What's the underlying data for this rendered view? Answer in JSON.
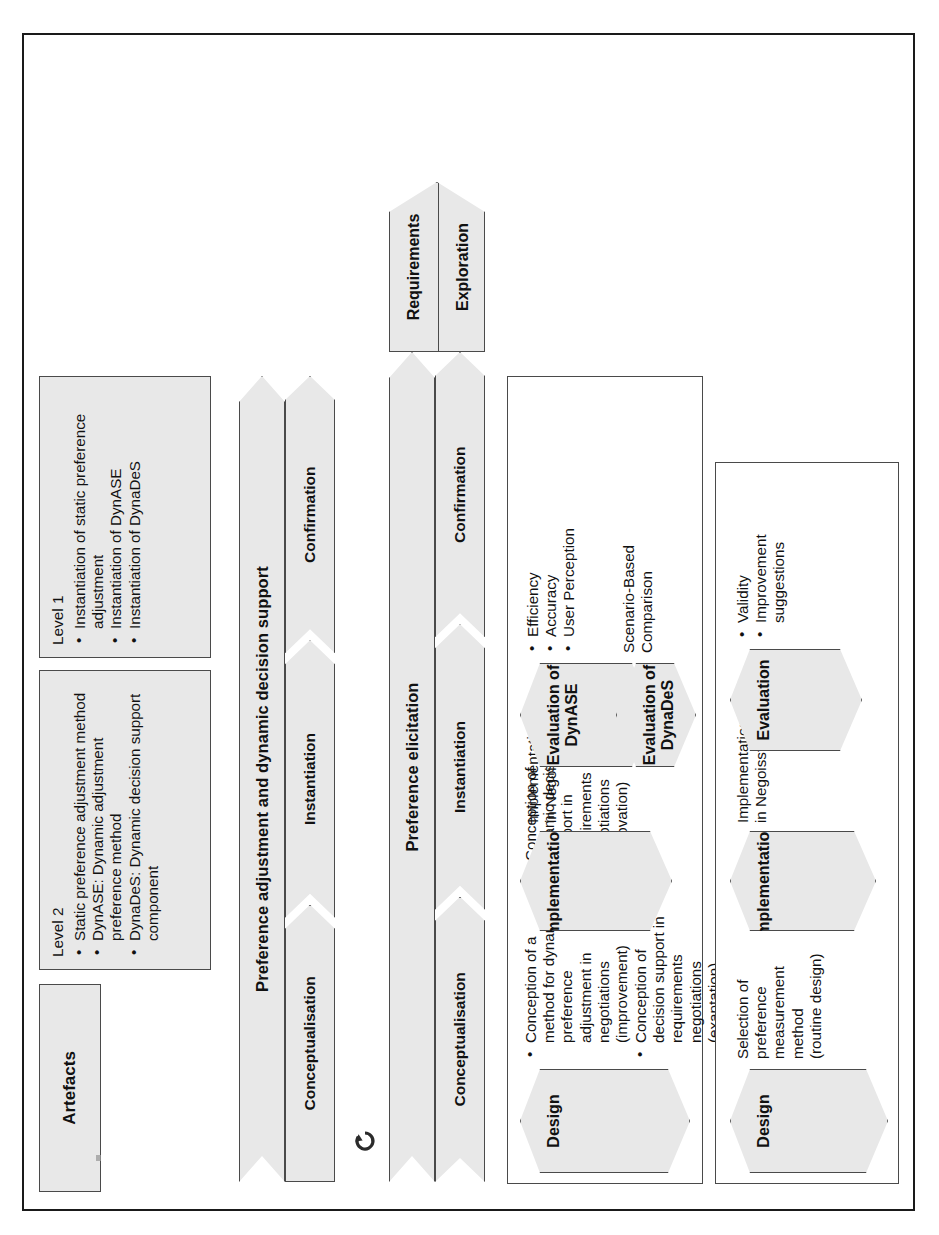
{
  "figure": {
    "frame_color": "#1a1a1a",
    "shape_fill": "#e8e8e8",
    "shape_stroke": "#4a4a4a"
  },
  "phases": [
    {
      "id": "phase1",
      "name": "Preference elicitation",
      "start_block": {
        "line1": "Requirements",
        "line2": "Exploration"
      },
      "substeps": [
        "Conceptualisation",
        "Instantiation",
        "Confirmation"
      ],
      "content": {
        "design": {
          "banner": "Design",
          "text": "Selection of\npreference\nmeasurement\nmethod\n(routine design)"
        },
        "implementation": {
          "banner": "Implementation",
          "text": "Implementation\nin Negoisst"
        },
        "evaluation": {
          "banner": "Evaluation",
          "bullets": [
            "Validity",
            "Improvement\nsuggestions"
          ]
        }
      }
    },
    {
      "id": "phase2",
      "name": "Preference adjustment and dynamic decision support",
      "substeps": [
        "Conceptualisation",
        "Instantiation",
        "Confirmation"
      ],
      "content": {
        "design": {
          "banner": "Design",
          "bullets": [
            "Conception of  a\nmethod for dynamic\npreference\nadjustment in\nnegotiations\n(improvement)",
            "Conception of\ndecision support in\nrequirements\nnegotiations\n(exaptation)",
            "Conception of\ndynamic decision\nsupport in\nrequirements\nnegotiations\n(innovation)"
          ]
        },
        "implementation": {
          "banner": "Implementation",
          "text": "Implementation\nin Negoisst"
        },
        "evaluation_dynase": {
          "banner": "Evaluation of\nDynASE",
          "bullets": [
            "Efficiency",
            "Accuracy",
            "User Perception"
          ]
        },
        "evaluation_dynades": {
          "banner": "Evaluation of\nDynaDeS",
          "text": "Scenario-Based\nComparison"
        }
      }
    }
  ],
  "artefacts": {
    "header": "Artefacts",
    "level2": {
      "title": "Level 2",
      "items": [
        "Static preference\nadjustment method",
        "DynASE: Dynamic\nadjustment\npreference method",
        "DynaDeS: Dynamic\ndecision support\ncomponent"
      ]
    },
    "level1": {
      "title": "Level 1",
      "items": [
        "Instantiation of\nstatic preference\nadjustment",
        "Instantiation of\nDynASE",
        "Instantiation of\nDynaDeS"
      ]
    }
  },
  "icons": {
    "loop": "refresh-loop-icon"
  }
}
